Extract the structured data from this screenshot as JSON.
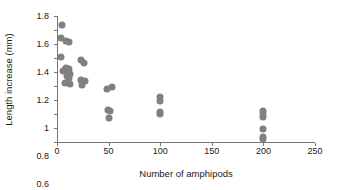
{
  "chart_data": {
    "type": "scatter",
    "title": "",
    "xlabel": "Number of amphipods",
    "ylabel": "Length increase (mm)",
    "xlim": [
      0,
      250
    ],
    "ylim": [
      0,
      1.8
    ],
    "xticks": [
      0,
      50,
      100,
      150,
      200,
      250
    ],
    "xtick_labels": [
      "0",
      "50",
      "100",
      "150",
      "200",
      "250"
    ],
    "yticks": [
      0,
      0.2,
      0.4,
      0.6,
      0.8,
      1.0,
      1.2,
      1.4,
      1.6,
      1.8
    ],
    "ytick_labels": [
      "0",
      "0.2",
      "0.4",
      "0.6",
      "0.8",
      "1",
      "1.2",
      "1.4",
      "1.6",
      "1.8"
    ],
    "grid": false,
    "legend": false,
    "marker_color": "#808080",
    "axis_color": "#767676",
    "text_color": "#1a1a1a",
    "points": [
      {
        "x": 5,
        "y": 1.67
      },
      {
        "x": 4,
        "y": 1.48
      },
      {
        "x": 9,
        "y": 1.45
      },
      {
        "x": 12,
        "y": 1.43
      },
      {
        "x": 4,
        "y": 1.21
      },
      {
        "x": 23,
        "y": 1.17
      },
      {
        "x": 26,
        "y": 1.13
      },
      {
        "x": 9,
        "y": 1.06
      },
      {
        "x": 12,
        "y": 1.04
      },
      {
        "x": 6,
        "y": 1.02
      },
      {
        "x": 11,
        "y": 1.0
      },
      {
        "x": 13,
        "y": 0.97
      },
      {
        "x": 10,
        "y": 0.94
      },
      {
        "x": 12,
        "y": 0.91
      },
      {
        "x": 23,
        "y": 0.89
      },
      {
        "x": 27,
        "y": 0.87
      },
      {
        "x": 8,
        "y": 0.85
      },
      {
        "x": 13,
        "y": 0.83
      },
      {
        "x": 24,
        "y": 0.82
      },
      {
        "x": 48,
        "y": 0.76
      },
      {
        "x": 53,
        "y": 0.78
      },
      {
        "x": 49,
        "y": 0.46
      },
      {
        "x": 51,
        "y": 0.44
      },
      {
        "x": 50,
        "y": 0.35
      },
      {
        "x": 100,
        "y": 0.65
      },
      {
        "x": 100,
        "y": 0.58
      },
      {
        "x": 100,
        "y": 0.43
      },
      {
        "x": 100,
        "y": 0.4
      },
      {
        "x": 200,
        "y": 0.45
      },
      {
        "x": 200,
        "y": 0.4
      },
      {
        "x": 200,
        "y": 0.36
      },
      {
        "x": 200,
        "y": 0.18
      },
      {
        "x": 200,
        "y": 0.07
      },
      {
        "x": 200,
        "y": 0.04
      }
    ]
  }
}
